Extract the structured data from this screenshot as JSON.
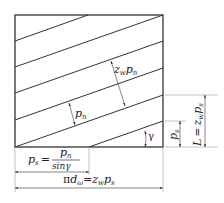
{
  "diagram": {
    "labels": {
      "zw_pn": {
        "main": "z",
        "sub": "w",
        "main2": "p",
        "sub2": "n"
      },
      "pn": {
        "main": "p",
        "sub": "n"
      },
      "gamma": "γ",
      "ps_right": {
        "main": "p",
        "sub": "s"
      },
      "L_eq": {
        "lhs": "L",
        "eq": "=",
        "main": "z",
        "sub": "w",
        "main2": "p",
        "sub2": "s"
      },
      "ps_eq": {
        "lhs": "p",
        "lhs_sub": "s",
        "eq": "=",
        "num": "p",
        "num_sub": "n",
        "den": "sinγ"
      },
      "pid_eq": {
        "pi": "π",
        "d": "d",
        "d_sub": "ω",
        "eq": "=",
        "main": "z",
        "sub": "w",
        "main2": "p",
        "sub2": "s"
      }
    },
    "colors": {
      "line": "#333333",
      "dim": "#555555",
      "ext": "#aaaaaa"
    }
  }
}
